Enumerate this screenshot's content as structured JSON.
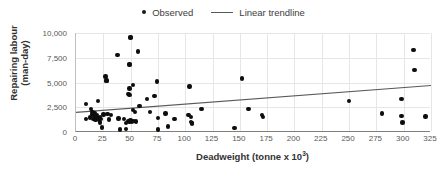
{
  "chart_data": {
    "type": "scatter",
    "title": "",
    "xlabel": "Deadweight (tonne x 10³)",
    "ylabel_line1": "Repairing labour",
    "ylabel_line2": "(man-day)",
    "xlabel_base": "Deadweight (tonne x 10",
    "xlabel_sup": "3",
    "xlabel_tail": ")",
    "xlim": [
      0,
      325
    ],
    "ylim": [
      0,
      10000
    ],
    "xticks": [
      0,
      25,
      50,
      75,
      100,
      125,
      150,
      175,
      200,
      225,
      250,
      275,
      300,
      325
    ],
    "xtick_labels": [
      "0",
      "25",
      "50",
      "75",
      "100",
      "125",
      "150",
      "175",
      "200",
      "225",
      "250",
      "275",
      "300",
      "325"
    ],
    "yticks": [
      0,
      2500,
      5000,
      7500,
      10000
    ],
    "ytick_labels": [
      "0",
      "2,500",
      "5,000",
      "7,500",
      "10,000"
    ],
    "grid": "both",
    "legend_position": "top-center",
    "legend": [
      {
        "label": "Observed",
        "marker": "dot",
        "color": "#0d0d0d"
      },
      {
        "label": "Linear trendline",
        "marker": "line",
        "color": "#595959"
      }
    ],
    "series": [
      {
        "name": "Observed",
        "marker_color": "#0d0d0d",
        "points": [
          [
            9,
            2850
          ],
          [
            9,
            1300
          ],
          [
            13,
            1450
          ],
          [
            14,
            2300
          ],
          [
            15,
            2050
          ],
          [
            15,
            1750
          ],
          [
            16,
            1300
          ],
          [
            17,
            1950
          ],
          [
            17,
            1600
          ],
          [
            18,
            1500
          ],
          [
            18,
            1200
          ],
          [
            19,
            1700
          ],
          [
            20,
            3150
          ],
          [
            20,
            1400
          ],
          [
            21,
            1250
          ],
          [
            22,
            1500
          ],
          [
            22,
            950
          ],
          [
            23,
            1300
          ],
          [
            24,
            450
          ],
          [
            25,
            1750
          ],
          [
            27,
            5600
          ],
          [
            28,
            5200
          ],
          [
            28,
            5150
          ],
          [
            29,
            1800
          ],
          [
            30,
            1250
          ],
          [
            32,
            1700
          ],
          [
            38,
            7800
          ],
          [
            39,
            1350
          ],
          [
            40,
            250
          ],
          [
            44,
            1300
          ],
          [
            46,
            900
          ],
          [
            46,
            300
          ],
          [
            48,
            3850
          ],
          [
            48,
            1100
          ],
          [
            49,
            6850
          ],
          [
            49,
            6750
          ],
          [
            49,
            4400
          ],
          [
            49,
            3750
          ],
          [
            49,
            1000
          ],
          [
            50,
            9600
          ],
          [
            50,
            9500
          ],
          [
            50,
            1150
          ],
          [
            51,
            1050
          ],
          [
            52,
            4750
          ],
          [
            52,
            2250
          ],
          [
            53,
            1100
          ],
          [
            54,
            2000
          ],
          [
            55,
            1050
          ],
          [
            57,
            8150
          ],
          [
            58,
            2650
          ],
          [
            65,
            3350
          ],
          [
            68,
            2050
          ],
          [
            72,
            3650
          ],
          [
            74,
            5100
          ],
          [
            75,
            1400
          ],
          [
            75,
            250
          ],
          [
            82,
            1850
          ],
          [
            84,
            550
          ],
          [
            90,
            1300
          ],
          [
            103,
            1700
          ],
          [
            104,
            4600
          ],
          [
            105,
            1500
          ],
          [
            105,
            1000
          ],
          [
            106,
            850
          ],
          [
            106,
            900
          ],
          [
            115,
            2300
          ],
          [
            145,
            400
          ],
          [
            152,
            5400
          ],
          [
            158,
            2300
          ],
          [
            170,
            1700
          ],
          [
            171,
            1500
          ],
          [
            250,
            3150
          ],
          [
            280,
            1850
          ],
          [
            298,
            3350
          ],
          [
            298,
            1600
          ],
          [
            299,
            950
          ],
          [
            309,
            8300
          ],
          [
            310,
            6250
          ],
          [
            320,
            1550
          ]
        ]
      }
    ],
    "trendline": {
      "name": "Linear trendline",
      "color": "#595959",
      "x_start": 0,
      "y_start": 1980,
      "x_end": 325,
      "y_end": 4700
    }
  }
}
